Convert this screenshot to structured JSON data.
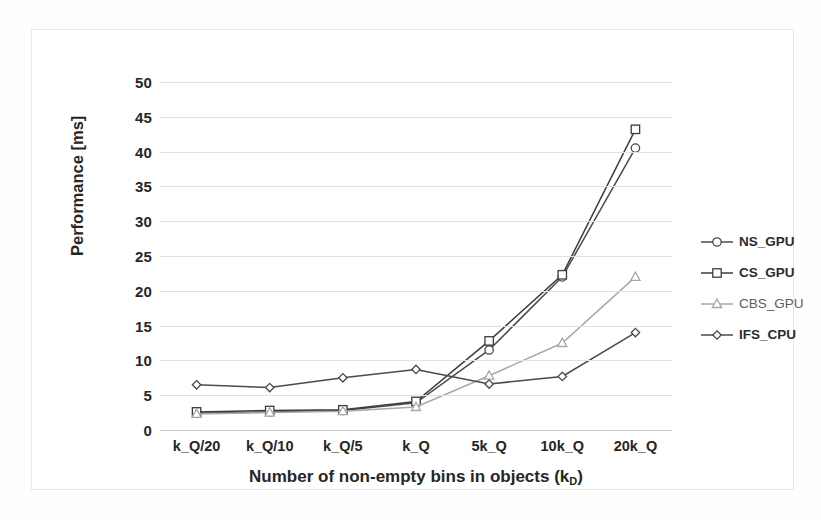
{
  "chart_data": {
    "type": "line",
    "title": "",
    "xlabel": "Number of non-empty bins in objects (k_D)",
    "ylabel": "Performance [ms]",
    "categories": [
      "k_Q/20",
      "k_Q/10",
      "k_Q/5",
      "k_Q",
      "5k_Q",
      "10k_Q",
      "20k_Q"
    ],
    "ylim": [
      0,
      50
    ],
    "ytick_values": [
      0,
      5,
      10,
      15,
      20,
      25,
      30,
      35,
      40,
      45,
      50
    ],
    "ytick_labels": [
      "0",
      "5",
      "10",
      "15",
      "20",
      "25",
      "30",
      "35",
      "40",
      "45",
      "50"
    ],
    "grid": true,
    "legend_position": "right",
    "series": [
      {
        "name": "NS_GPU",
        "marker": "circle",
        "color": "#4a4a4a",
        "values": [
          2.4,
          2.6,
          2.8,
          3.9,
          11.5,
          22.0,
          40.5
        ]
      },
      {
        "name": "CS_GPU",
        "marker": "square",
        "color": "#3c3c3c",
        "values": [
          2.6,
          2.8,
          2.9,
          4.1,
          12.8,
          22.3,
          43.2
        ]
      },
      {
        "name": "CBS_GPU",
        "marker": "triangle",
        "color": "#a8a8a8",
        "values": [
          2.3,
          2.5,
          2.7,
          3.3,
          7.8,
          12.5,
          22.0
        ]
      },
      {
        "name": "IFS_CPU",
        "marker": "diamond",
        "color": "#4a4a4a",
        "values": [
          6.5,
          6.1,
          7.5,
          8.7,
          6.6,
          7.7,
          14.0
        ]
      }
    ]
  },
  "axes": {
    "y_title": "Performance [ms]",
    "x_title_main": "Number of non-empty bins in objects (k",
    "x_title_sub": "D",
    "x_title_end": ")"
  },
  "legend": {
    "items": [
      {
        "label": "NS_GPU",
        "marker": "circle-marker",
        "color": "#4a4a4a"
      },
      {
        "label": "CS_GPU",
        "marker": "square-marker",
        "color": "#3c3c3c"
      },
      {
        "label": "CBS_GPU",
        "marker": "triangle-marker",
        "color": "#a8a8a8"
      },
      {
        "label": "IFS_CPU",
        "marker": "diamond-marker",
        "color": "#4a4a4a"
      }
    ]
  },
  "colors": {
    "gridline": "#e2e2e2",
    "axis": "#c9c9c9",
    "text": "#262626",
    "frame": "#e9e9e9"
  }
}
